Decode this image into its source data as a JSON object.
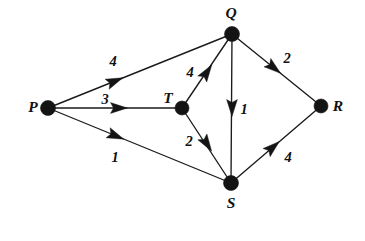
{
  "figure": {
    "kind": "weighted-directed-graph",
    "background_color": "#ffffff",
    "ink_color": "#141414"
  },
  "nodes": [
    {
      "id": "P",
      "label": "P",
      "x": 48,
      "y": 108,
      "label_x": 33,
      "label_y": 107,
      "radius": 7.5
    },
    {
      "id": "Q",
      "label": "Q",
      "x": 232,
      "y": 34,
      "label_x": 231,
      "label_y": 13,
      "radius": 7.5
    },
    {
      "id": "T",
      "label": "T",
      "x": 182,
      "y": 108,
      "label_x": 168,
      "label_y": 98,
      "radius": 7.0
    },
    {
      "id": "R",
      "label": "R",
      "x": 321,
      "y": 106,
      "label_x": 338,
      "label_y": 106,
      "radius": 7.0
    },
    {
      "id": "S",
      "label": "S",
      "x": 231,
      "y": 183,
      "label_x": 231,
      "label_y": 203,
      "radius": 7.5
    }
  ],
  "edges": [
    {
      "id": "P-Q",
      "from": "P",
      "to": "Q",
      "weight": "4",
      "x1": 48,
      "y1": 108,
      "x2": 232,
      "y2": 34,
      "arrow_x": 115,
      "arrow_y": 81,
      "arrow_angle": 338,
      "label_x": 113,
      "label_y": 61
    },
    {
      "id": "P-T",
      "from": "P",
      "to": "T",
      "weight": "3",
      "x1": 48,
      "y1": 108,
      "x2": 182,
      "y2": 108,
      "arrow_x": 119,
      "arrow_y": 108,
      "arrow_angle": 0,
      "label_x": 105,
      "label_y": 99
    },
    {
      "id": "P-S",
      "from": "P",
      "to": "S",
      "weight": "1",
      "x1": 48,
      "y1": 108,
      "x2": 231,
      "y2": 183,
      "arrow_x": 116,
      "arrow_y": 136,
      "arrow_angle": 22,
      "label_x": 115,
      "label_y": 157
    },
    {
      "id": "T-Q",
      "from": "T",
      "to": "Q",
      "weight": "4",
      "x1": 182,
      "y1": 108,
      "x2": 232,
      "y2": 34,
      "arrow_x": 207,
      "arrow_y": 72,
      "arrow_angle": 304,
      "label_x": 190,
      "label_y": 72
    },
    {
      "id": "T-S",
      "from": "T",
      "to": "S",
      "weight": "2",
      "x1": 182,
      "y1": 108,
      "x2": 231,
      "y2": 183,
      "arrow_x": 207,
      "arrow_y": 144,
      "arrow_angle": 57,
      "label_x": 189,
      "label_y": 141
    },
    {
      "id": "Q-S",
      "from": "Q",
      "to": "S",
      "weight": "1",
      "x1": 232,
      "y1": 34,
      "x2": 231,
      "y2": 183,
      "arrow_x": 232,
      "arrow_y": 108,
      "arrow_angle": 90,
      "label_x": 244,
      "label_y": 109
    },
    {
      "id": "Q-R",
      "from": "Q",
      "to": "R",
      "weight": "2",
      "x1": 232,
      "y1": 34,
      "x2": 321,
      "y2": 106,
      "arrow_x": 274,
      "arrow_y": 68,
      "arrow_angle": 39,
      "label_x": 287,
      "label_y": 58
    },
    {
      "id": "S-R",
      "from": "S",
      "to": "R",
      "weight": "4",
      "x1": 231,
      "y1": 183,
      "x2": 321,
      "y2": 106,
      "arrow_x": 273,
      "arrow_y": 147,
      "arrow_angle": 319,
      "label_x": 288,
      "label_y": 157
    }
  ]
}
